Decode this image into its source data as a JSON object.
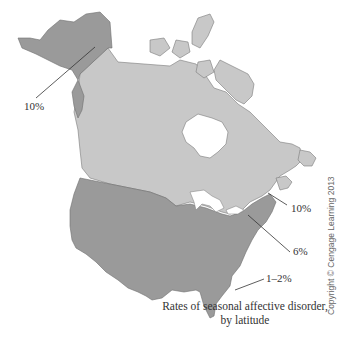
{
  "figure": {
    "caption_line1": "Rates of seasonal affective disorder,",
    "caption_line2": "by latitude",
    "copyright": "Copyright © Cengage Learning 2013"
  },
  "regions": [
    {
      "name": "Alaska",
      "rate": "10%",
      "color": "#9a9a9a"
    },
    {
      "name": "Canada",
      "rate": "",
      "color": "#c8c8c8"
    },
    {
      "name": "Contiguous United States",
      "rate": "",
      "color": "#9a9a9a"
    },
    {
      "name": "New England",
      "rate": "10%",
      "color": "#9a9a9a"
    },
    {
      "name": "Mid-Atlantic",
      "rate": "6%",
      "color": "#9a9a9a"
    },
    {
      "name": "Florida",
      "rate": "1–2%",
      "color": "#9a9a9a"
    }
  ],
  "labels": {
    "alaska": "10%",
    "new_england": "10%",
    "mid_atlantic": "6%",
    "florida": "1–2%"
  },
  "colors": {
    "dark_region": "#9a9a9a",
    "light_region": "#c8c8c8",
    "outline": "#6f6f6f",
    "water": "#ffffff"
  }
}
